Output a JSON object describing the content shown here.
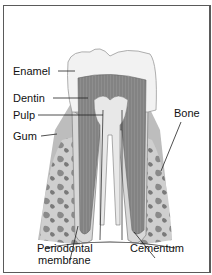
{
  "diagram": {
    "labels": {
      "enamel": "Enamel",
      "dentin": "Dentin",
      "pulp": "Pulp",
      "gum": "Gum",
      "bone": "Bone",
      "periodontal_1": "Periodontal",
      "periodontal_2": "membrane",
      "cementum": "Cementum"
    }
  }
}
